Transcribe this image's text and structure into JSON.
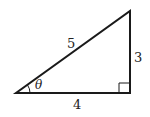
{
  "diagram": {
    "type": "right-triangle",
    "labels": {
      "hypotenuse": "5",
      "opposite": "3",
      "adjacent": "4",
      "angle": "θ"
    },
    "right_angle_marker": true,
    "stroke_color": "#1a1a1a"
  }
}
